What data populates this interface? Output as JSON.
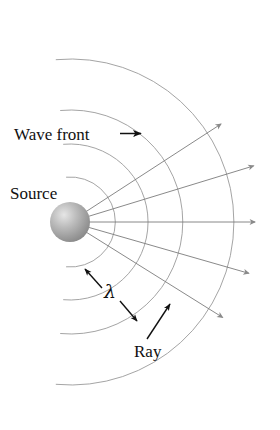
{
  "figure": {
    "background_color": "#ffffff",
    "labels": {
      "wave_front": "Wave front",
      "source": "Source",
      "ray": "Ray",
      "wavelength_symbol": "λ"
    },
    "colors": {
      "arc_stroke": "#9a9a9a",
      "ray_stroke": "#7c7c7c",
      "arrow_fill": "#8a8a8a",
      "label_text": "#111111",
      "pointer_stroke": "#111111",
      "sphere_light": "#e2e2e2",
      "sphere_mid": "#b0b0b0",
      "sphere_dark": "#8c8c8c"
    },
    "source_point": {
      "x": 70,
      "y": 222,
      "radius": 20
    },
    "wave_fronts": [
      {
        "name": "wave-front-1",
        "radius": 45
      },
      {
        "name": "wave-front-2",
        "radius": 78
      },
      {
        "name": "wave-front-3",
        "radius": 112
      },
      {
        "name": "wave-front-4",
        "radius": 163
      }
    ],
    "arc_span_degrees": {
      "start": -95,
      "end": 95
    },
    "rays": [
      {
        "name": "ray-1",
        "angle_deg": -33,
        "length": 180
      },
      {
        "name": "ray-2",
        "angle_deg": -17,
        "length": 192
      },
      {
        "name": "ray-3",
        "angle_deg": 0,
        "length": 192
      },
      {
        "name": "ray-4",
        "angle_deg": 16,
        "length": 186
      },
      {
        "name": "ray-5",
        "angle_deg": 32,
        "length": 180
      }
    ],
    "annotations": {
      "wave_front_label_pos": {
        "x": 14,
        "y": 140
      },
      "wave_front_arrow": {
        "x1": 120,
        "y1": 133,
        "x2": 143,
        "y2": 133
      },
      "source_label_pos": {
        "x": 10,
        "y": 199
      },
      "lambda_label_pos": {
        "x": 105,
        "y": 297
      },
      "lambda_arrow_upper": {
        "x1": 101,
        "y1": 286,
        "x2": 84,
        "y2": 268
      },
      "lambda_arrow_lower": {
        "x1": 119,
        "y1": 300,
        "x2": 137,
        "y2": 320
      },
      "ray_label_pos": {
        "x": 136,
        "y": 355
      },
      "ray_arrow": {
        "x1": 146,
        "y1": 338,
        "x2": 170,
        "y2": 303
      }
    }
  }
}
